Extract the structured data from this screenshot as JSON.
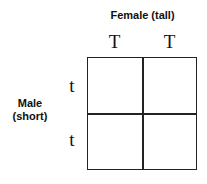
{
  "diagram": {
    "type": "punnett-square",
    "column_header": "Female (tall)",
    "row_header_line1": "Male",
    "row_header_line2": "(short)",
    "column_alleles": [
      "T",
      "T"
    ],
    "row_alleles": [
      "t",
      "t"
    ],
    "cells": [
      [
        "",
        ""
      ],
      [
        "",
        ""
      ]
    ]
  }
}
